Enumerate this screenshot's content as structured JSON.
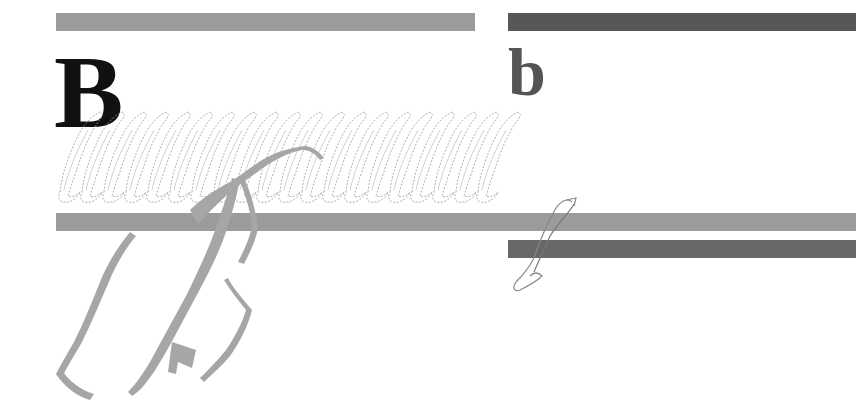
{
  "figure": {
    "panels": [
      {
        "label": "B",
        "description": "stacked cross-beta sheet fibril model (side view) with one highlighted monomer trace"
      },
      {
        "label": "b",
        "description": "single monomer trace (cross-section view)"
      }
    ],
    "bars": [
      {
        "name": "top-left-bar",
        "x": 56,
        "y": 13,
        "w": 419,
        "color": "#9b9b9b"
      },
      {
        "name": "top-right-bar",
        "x": 508,
        "y": 13,
        "w": 348,
        "color": "#575757"
      },
      {
        "name": "middle-bar",
        "x": 56,
        "y": 213,
        "w": 800,
        "color": "#9b9b9b"
      },
      {
        "name": "lower-right-bar",
        "x": 508,
        "y": 240,
        "w": 348,
        "color": "#686868"
      }
    ],
    "colors": {
      "label_B": "#111111",
      "label_b": "#555555",
      "ribbon": "#a6a6a6",
      "outline": "#9a9a9a"
    }
  }
}
